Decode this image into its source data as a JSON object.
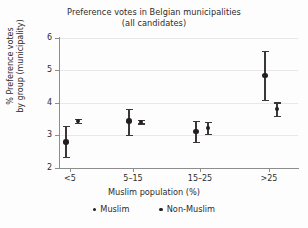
{
  "chart_data": {
    "type": "scatter",
    "title": "Preference votes in Belgian municipalities",
    "subtitle": "(all candidates)",
    "xlabel": "Muslim population (%)",
    "ylabel_line1": "% Preference votes",
    "ylabel_line2": "by group (municipality)",
    "categories": [
      "<5",
      "5–15",
      "15–25",
      ">25"
    ],
    "yticks": [
      "6",
      "5",
      "4",
      "3",
      "2"
    ],
    "ylim": [
      2,
      6
    ],
    "grid": true,
    "legend_position": "bottom",
    "series": [
      {
        "name": "Muslim",
        "marker": "filled-circle-large",
        "color": "#231f20",
        "values": [
          2.8,
          3.45,
          3.13,
          4.85
        ],
        "ci_low": [
          2.35,
          3.03,
          2.8,
          4.1
        ],
        "ci_high": [
          3.3,
          3.82,
          3.45,
          5.6
        ]
      },
      {
        "name": "Non-Muslim",
        "marker": "filled-circle-small",
        "color": "#231f20",
        "values": [
          3.44,
          3.42,
          3.24,
          3.82
        ],
        "ci_low": [
          3.38,
          3.37,
          3.05,
          3.6
        ],
        "ci_high": [
          3.5,
          3.47,
          3.43,
          4.02
        ]
      }
    ]
  },
  "legend": {
    "items": [
      {
        "label": "Muslim"
      },
      {
        "label": "Non-Muslim"
      }
    ]
  }
}
